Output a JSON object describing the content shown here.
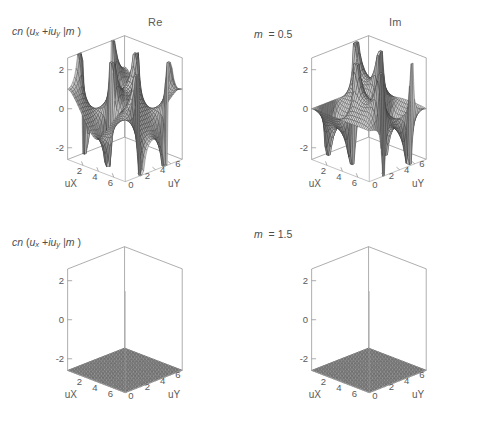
{
  "figure": {
    "width": 488,
    "height": 422,
    "background": "#ffffff",
    "layout": "2x2 grid of 3D surface plots"
  },
  "columns": [
    {
      "id": "re",
      "title": "Re"
    },
    {
      "id": "im",
      "title": "Im"
    }
  ],
  "rows": [
    {
      "id": "m05",
      "m_label_prefix": "m",
      "m_label_value": "= 0.5",
      "m": 0.5
    },
    {
      "id": "m15",
      "m_label_prefix": "m",
      "m_label_value": "= 1.5",
      "m": 1.5
    }
  ],
  "function_label": {
    "head": "cn",
    "open": "(",
    "u": "u",
    "sub_x": "x",
    "plus": "+",
    "i": "i",
    "u2": "u",
    "sub_y": "y",
    "bar": "| m",
    "close": ")",
    "plain": "cn (u_x + i u_y | m )"
  },
  "axes": {
    "x": {
      "name": "uX",
      "ticks": [
        "2",
        "4",
        "6"
      ],
      "tick_values": [
        2,
        4,
        6
      ],
      "range": [
        0,
        7.5
      ]
    },
    "y": {
      "name": "uY",
      "ticks": [
        "2",
        "4",
        "6"
      ],
      "tick_values": [
        2,
        4,
        6
      ],
      "range": [
        0,
        7.5
      ]
    },
    "z": {
      "name": "",
      "ticks": [
        "2",
        "0",
        "-2"
      ],
      "tick_values": [
        2,
        0,
        -2
      ],
      "range": [
        -2.6,
        2.6
      ]
    },
    "origin_tick": "0"
  },
  "panels": [
    {
      "id": "panel-re-m05",
      "column": "Re",
      "row": "m = 0.5",
      "part": "re",
      "m": 0.5,
      "zlabel": "cn (u_x + i u_y | m )",
      "col_title": "Re",
      "m_text": "m  = 0.5"
    },
    {
      "id": "panel-im-m05",
      "column": "Im",
      "row": "m = 0.5",
      "part": "im",
      "m": 0.5,
      "zlabel": "",
      "col_title": "Im",
      "m_text": "m  = 0.5"
    },
    {
      "id": "panel-re-m15",
      "column": "Re",
      "row": "m = 1.5",
      "part": "re",
      "m": 1.5,
      "zlabel": "cn (u_x + i u_y | m )",
      "col_title": "",
      "m_text": "m  = 1.5"
    },
    {
      "id": "panel-im-m15",
      "column": "Im",
      "row": "m = 1.5",
      "part": "im",
      "m": 1.5,
      "zlabel": "",
      "col_title": "",
      "m_text": "m  = 1.5"
    }
  ],
  "chart_data": {
    "type": "surface",
    "title": "",
    "xlabel": "uX",
    "ylabel": "uY",
    "zlabel": "cn (u_x + i u_y | m )",
    "xlim": [
      0,
      7.5
    ],
    "ylim": [
      0,
      7.5
    ],
    "zlim": [
      -2.6,
      2.6
    ],
    "xticks": [
      2,
      4,
      6
    ],
    "yticks": [
      2,
      4,
      6
    ],
    "zticks": [
      -2,
      0,
      2
    ],
    "grid": true,
    "legend": null,
    "mesh_resolution": 34,
    "surface_style": "grayscale shaded wireframe mesh",
    "clipped_at": [
      -2.6,
      2.6
    ],
    "series": [
      {
        "name": "Re cn, m = 0.5",
        "part": "re",
        "m": 0.5,
        "panel": "top-left"
      },
      {
        "name": "Im cn, m = 0.5",
        "part": "im",
        "m": 0.5,
        "panel": "top-right"
      },
      {
        "name": "Re cn, m = 1.5",
        "part": "re",
        "m": 1.5,
        "panel": "bottom-left"
      },
      {
        "name": "Im cn, m = 1.5",
        "part": "im",
        "m": 1.5,
        "panel": "bottom-right"
      }
    ]
  },
  "colors": {
    "axis": "#8b8b8b",
    "text": "#5a5a5a",
    "mesh_line": "#2e2e2e",
    "face_light": "#d8d8d8",
    "face_dark": "#5e5e5e",
    "background": "#ffffff"
  }
}
